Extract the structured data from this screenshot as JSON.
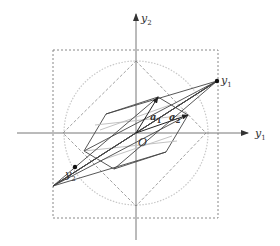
{
  "figure": {
    "axes": {
      "horizontal_label": "y",
      "horizontal_subscript": "1",
      "vertical_label": "y",
      "vertical_subscript": "2",
      "origin_label": "O"
    },
    "vectors": [
      {
        "label": "a",
        "subscript": "1"
      },
      {
        "label": "a",
        "subscript": "2"
      }
    ],
    "points": [
      {
        "label": "y",
        "subscript": "1"
      },
      {
        "label": "y",
        "subscript": "2"
      }
    ],
    "shapes": {
      "dashed_square": "bounding box",
      "dashed_diamond": "l1 ball",
      "dotted_circle": "l2 ball",
      "hexagon": "zonotope spanned by a1, a2"
    },
    "colors": {
      "axis": "#777777",
      "lines": "#444444",
      "light": "#bbbbbb",
      "dashed": "#888888"
    }
  }
}
